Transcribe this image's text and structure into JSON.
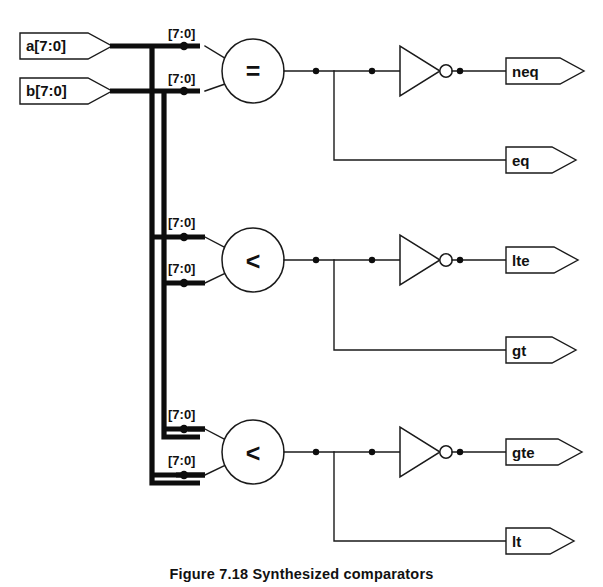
{
  "figure": {
    "caption": "Figure 7.18 Synthesized comparators",
    "bus_width_label": "[7:0]"
  },
  "inputs": [
    {
      "name": "a",
      "label": "a[7:0]",
      "signal": "a",
      "x": 20,
      "y": 33
    },
    {
      "name": "b",
      "label": "b[7:0]",
      "signal": "b",
      "x": 20,
      "y": 78
    }
  ],
  "comparators": [
    {
      "name": "equal",
      "operator": "=",
      "cx": 253,
      "cy": 71,
      "input_a_label": "[7:0]",
      "input_b_label": "[7:0]"
    },
    {
      "name": "less-than-upper",
      "operator": "<",
      "cx": 253,
      "cy": 260,
      "input_a_label": "[7:0]",
      "input_b_label": "[7:0]"
    },
    {
      "name": "less-than-lower",
      "operator": "<",
      "cx": 253,
      "cy": 452,
      "input_a_label": "[7:0]",
      "input_b_label": "[7:0]"
    }
  ],
  "inverters": [
    {
      "name": "inverter-neq",
      "x": 400,
      "y": 71
    },
    {
      "name": "inverter-lte",
      "x": 400,
      "y": 260
    },
    {
      "name": "inverter-gte",
      "x": 400,
      "y": 452
    }
  ],
  "outputs": [
    {
      "name": "neq",
      "label": "neq",
      "y": 71,
      "source": "inverted-equal"
    },
    {
      "name": "eq",
      "label": "eq",
      "y": 160,
      "source": "equal"
    },
    {
      "name": "lte",
      "label": "lte",
      "y": 260,
      "source": "inverted-less-than-upper"
    },
    {
      "name": "gt",
      "label": "gt",
      "y": 350,
      "source": "less-than-upper"
    },
    {
      "name": "gte",
      "label": "gte",
      "y": 452,
      "source": "inverted-less-than-lower"
    },
    {
      "name": "lt",
      "label": "lt",
      "y": 541,
      "source": "less-than-lower"
    }
  ],
  "bus_taps": [
    {
      "label": "[7:0]",
      "x": 178,
      "y": 38
    },
    {
      "label": "[7:0]",
      "x": 178,
      "y": 83
    },
    {
      "label": "[7:0]",
      "x": 178,
      "y": 227
    },
    {
      "label": "[7:0]",
      "x": 178,
      "y": 272
    },
    {
      "label": "[7:0]",
      "x": 178,
      "y": 419
    },
    {
      "label": "[7:0]",
      "x": 178,
      "y": 464
    }
  ],
  "colors": {
    "wire": "#1a1a1a",
    "bus": "#0d0d0d",
    "background": "#ffffff",
    "text": "#111111"
  }
}
